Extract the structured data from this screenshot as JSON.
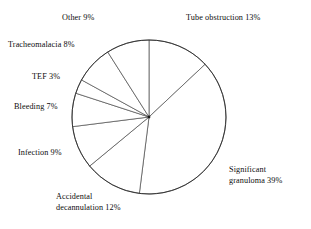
{
  "chart_data": {
    "type": "pie",
    "title": "",
    "subtitle": "",
    "xlabel": "",
    "ylabel": "",
    "legend_position": "none",
    "grid": false,
    "units": "percent",
    "total": 100,
    "start_angle_deg": 0,
    "direction": "clockwise",
    "categories": [
      "Tube obstruction",
      "Significant granuloma",
      "Accidental decannulation",
      "Infection",
      "Bleeding",
      "TEF",
      "Tracheomalacia",
      "Other"
    ],
    "values": [
      13,
      39,
      12,
      9,
      7,
      3,
      8,
      9
    ],
    "slices": [
      {
        "label": "Tube obstruction",
        "value": 13,
        "text": "Tube obstruction 13%"
      },
      {
        "label": "Significant granuloma",
        "value": 39,
        "text": "Significant granuloma 39%"
      },
      {
        "label": "Accidental decannulation",
        "value": 12,
        "text": "Accidental decannulation 12%"
      },
      {
        "label": "Infection",
        "value": 9,
        "text": "Infection 9%"
      },
      {
        "label": "Bleeding",
        "value": 7,
        "text": "Bleeding 7%"
      },
      {
        "label": "TEF",
        "value": 3,
        "text": "TEF 3%"
      },
      {
        "label": "Tracheomalacia",
        "value": 8,
        "text": "Tracheomalacia 8%"
      },
      {
        "label": "Other",
        "value": 9,
        "text": "Other 9%"
      }
    ]
  },
  "labels": {
    "other": "Other 9%",
    "tube_obstruction": "Tube obstruction 13%",
    "tracheomalacia": "Tracheomalacia 8%",
    "tef": "TEF 3%",
    "bleeding": "Bleeding 7%",
    "infection": "Infection 9%",
    "accidental_decannulation_line1": "Accidental",
    "accidental_decannulation_line2": "decannulation 12%",
    "significant_granuloma_line1": "Significant",
    "significant_granuloma_line2": "granuloma 39%"
  },
  "colors": {
    "slice_fill": "#ffffff",
    "slice_stroke": "#4a4a4a",
    "outline_stroke": "#2b2b2b",
    "text": "#0d0d0d",
    "background": "#ffffff"
  },
  "geometry": {
    "center_x": 149,
    "center_y": 117,
    "radius": 77
  }
}
